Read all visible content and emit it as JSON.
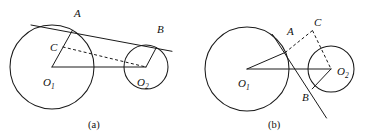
{
  "figure": {
    "background_color": "#ffffff",
    "ink_color": "#1a1a1a",
    "panels": [
      {
        "id": "panel-a",
        "caption": "(a)",
        "caption_x": 88,
        "caption_y": 128,
        "description": "External common tangent to two circles",
        "circles": [
          {
            "name": "large-circle",
            "cx": 52,
            "cy": 67,
            "r": 42
          },
          {
            "name": "small-circle",
            "cx": 146,
            "cy": 67,
            "r": 22
          }
        ],
        "points": [
          {
            "label": "A",
            "x": 72.5,
            "y": 30.2,
            "label_x": 74,
            "label_y": 17,
            "sub": ""
          },
          {
            "label": "B",
            "x": 156.3,
            "y": 47.6,
            "label_x": 157,
            "label_y": 33,
            "sub": ""
          },
          {
            "label": "C",
            "x": 62.6,
            "y": 46.9,
            "label_x": 50,
            "label_y": 51,
            "sub": ""
          },
          {
            "label": "O",
            "x": 52,
            "y": 67,
            "label_x": 43,
            "label_y": 86,
            "sub": "1"
          },
          {
            "label": "O",
            "x": 146,
            "y": 67,
            "label_x": 137,
            "label_y": 86,
            "sub": "2"
          }
        ],
        "solid_segments": [
          {
            "name": "tangent-line-AB",
            "x1": 31,
            "y1": 25,
            "x2": 172,
            "y2": 51.3
          },
          {
            "name": "radius-O1-A",
            "x1": 52,
            "y1": 67,
            "x2": 72.5,
            "y2": 30.2
          },
          {
            "name": "radius-O2-B",
            "x1": 146,
            "y1": 67,
            "x2": 156.3,
            "y2": 47.6
          },
          {
            "name": "center-line-O1-O2",
            "x1": 52,
            "y1": 67,
            "x2": 146,
            "y2": 67
          }
        ],
        "dashed_segments": [
          {
            "name": "parallel-segment-C-O2",
            "x1": 62.6,
            "y1": 46.9,
            "x2": 146,
            "y2": 67
          }
        ]
      },
      {
        "id": "panel-b",
        "caption": "(b)",
        "caption_x": 268,
        "caption_y": 128,
        "description": "Internal common tangent to two circles",
        "circles": [
          {
            "name": "large-circle",
            "cx": 247,
            "cy": 69,
            "r": 42
          },
          {
            "name": "small-circle",
            "cx": 331,
            "cy": 69,
            "r": 23
          }
        ],
        "points": [
          {
            "label": "A",
            "x": 285.3,
            "y": 52.4,
            "label_x": 287,
            "label_y": 35,
            "sub": ""
          },
          {
            "label": "B",
            "x": 312.2,
            "y": 88.9,
            "label_x": 302,
            "label_y": 101,
            "sub": ""
          },
          {
            "label": "C",
            "x": 312.5,
            "y": 30.5,
            "label_x": 314,
            "label_y": 26,
            "sub": ""
          },
          {
            "label": "O",
            "x": 247,
            "y": 69,
            "label_x": 238,
            "label_y": 87,
            "sub": "1"
          },
          {
            "label": "O",
            "x": 331,
            "y": 69,
            "label_x": 337,
            "label_y": 75,
            "sub": "2"
          }
        ],
        "solid_segments": [
          {
            "name": "tangent-line-AB",
            "x1": 272.5,
            "y1": 34.5,
            "x2": 326.5,
            "y2": 118
          },
          {
            "name": "radius-O1-A",
            "x1": 247,
            "y1": 69,
            "x2": 285.3,
            "y2": 52.4
          },
          {
            "name": "radius-O2-B",
            "x1": 331,
            "y1": 69,
            "x2": 312.2,
            "y2": 88.9
          },
          {
            "name": "center-line-O1-O2",
            "x1": 247,
            "y1": 69,
            "x2": 331,
            "y2": 69
          }
        ],
        "dashed_segments": [
          {
            "name": "dashed-segment-C-A",
            "x1": 312.5,
            "y1": 30.5,
            "x2": 285.3,
            "y2": 52.4
          },
          {
            "name": "dashed-segment-C-O2",
            "x1": 312.5,
            "y1": 30.5,
            "x2": 331,
            "y2": 69
          }
        ]
      }
    ]
  }
}
